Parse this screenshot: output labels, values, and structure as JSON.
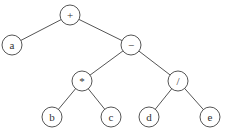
{
  "diagram": {
    "type": "expression-tree",
    "nodes": [
      {
        "id": "plus",
        "label": "+",
        "x": 70,
        "y": 15
      },
      {
        "id": "a",
        "label": "a",
        "x": 12,
        "y": 45
      },
      {
        "id": "minus",
        "label": "−",
        "x": 131,
        "y": 45
      },
      {
        "id": "mul",
        "label": "*",
        "x": 82,
        "y": 81
      },
      {
        "id": "div",
        "label": "/",
        "x": 178,
        "y": 81
      },
      {
        "id": "b",
        "label": "b",
        "x": 52,
        "y": 117
      },
      {
        "id": "c",
        "label": "c",
        "x": 111,
        "y": 117
      },
      {
        "id": "d",
        "label": "d",
        "x": 149,
        "y": 117
      },
      {
        "id": "e",
        "label": "e",
        "x": 210,
        "y": 117
      }
    ],
    "edges": [
      [
        "plus",
        "a"
      ],
      [
        "plus",
        "minus"
      ],
      [
        "minus",
        "mul"
      ],
      [
        "minus",
        "div"
      ],
      [
        "mul",
        "b"
      ],
      [
        "mul",
        "c"
      ],
      [
        "div",
        "d"
      ],
      [
        "div",
        "e"
      ]
    ],
    "radius": 10
  }
}
